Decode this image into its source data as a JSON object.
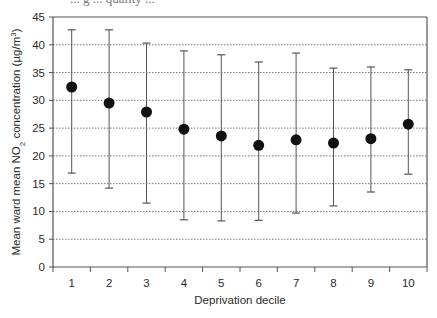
{
  "header": {
    "cropped_title_fragment": "... g ... quality ..."
  },
  "chart_data": {
    "type": "scatter",
    "subtype": "point-with-error-bars",
    "title": "",
    "xlabel": "Deprivation decile",
    "ylabel": "Mean ward mean NO2 concentration (µg/m3)",
    "ylabel_parts": {
      "pre": "Mean ward mean NO",
      "sub": "2",
      "mid": " concentration (µg/m",
      "sup": "3",
      "post": ")"
    },
    "categories": [
      "1",
      "2",
      "3",
      "4",
      "5",
      "6",
      "7",
      "8",
      "9",
      "10"
    ],
    "series": [
      {
        "name": "Mean ward mean NO2",
        "values": [
          32.4,
          29.5,
          27.9,
          24.8,
          23.6,
          21.9,
          22.9,
          22.3,
          23.1,
          25.7
        ],
        "upper": [
          42.7,
          42.7,
          40.3,
          38.9,
          38.2,
          36.9,
          38.5,
          35.8,
          36.0,
          35.5
        ],
        "lower": [
          16.9,
          14.2,
          11.5,
          8.5,
          8.3,
          8.4,
          9.7,
          11.0,
          13.5,
          16.7
        ]
      }
    ],
    "ylim": [
      0,
      45
    ],
    "yticks": [
      0,
      5,
      10,
      15,
      20,
      25,
      30,
      35,
      40,
      45
    ],
    "grid": {
      "y": true,
      "style": "dotted",
      "x": false
    },
    "legend": null,
    "colors": {
      "marker": "#111111",
      "errorbar": "#555555",
      "grid": "#777777",
      "axis": "#555555",
      "text": "#2a2a2a"
    }
  }
}
